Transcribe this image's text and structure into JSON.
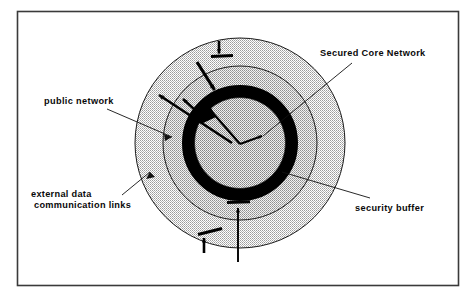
{
  "figure": {
    "frame": {
      "visible": true,
      "color": "#3a3a3a"
    }
  },
  "labels": {
    "secured_core_network": "Secured Core Network",
    "public_network": "public network",
    "external_data_links_line1": "external data",
    "external_data_links_line2": "communication links",
    "security_buffer": "security buffer"
  },
  "colors": {
    "outer_zone_fill": "#d8d8d8",
    "middle_zone_fill": "#c9c9c9",
    "core_fill": "#bfbfbf",
    "buffer_ring": "#000000",
    "stroke": "#1a1a1a",
    "text": "#0a0a0a",
    "frame": "#3a3a3a",
    "background": "#ffffff"
  },
  "geometry": {
    "center_x": 240,
    "center_y": 143,
    "outer_radius": 105,
    "middle_radius": 77,
    "buffer_outer_radius": 58,
    "buffer_inner_radius": 45
  },
  "zones": [
    {
      "name": "public-network-zone",
      "label_ref": "public_network",
      "radius": 105
    },
    {
      "name": "intermediate-zone",
      "label_ref": "external_data_links",
      "radius": 77
    },
    {
      "name": "security-buffer-ring",
      "label_ref": "security_buffer",
      "radius": 58
    },
    {
      "name": "secured-core-zone",
      "label_ref": "secured_core_network",
      "radius": 45
    }
  ],
  "links": [
    {
      "name": "inbound-link-top",
      "direction": "inward",
      "blocked": true
    },
    {
      "name": "inbound-link-upper-left",
      "direction": "inward",
      "blocked": true
    },
    {
      "name": "outbound-link-upper-left",
      "direction": "outward",
      "blocked": false
    },
    {
      "name": "outbound-link-left",
      "direction": "outward",
      "blocked": false
    },
    {
      "name": "inbound-link-bottom",
      "direction": "inward",
      "blocked": true
    },
    {
      "name": "inbound-link-bottom-left",
      "direction": "inward",
      "blocked": true
    },
    {
      "name": "core-pointer",
      "direction": "inward",
      "blocked": false
    }
  ]
}
